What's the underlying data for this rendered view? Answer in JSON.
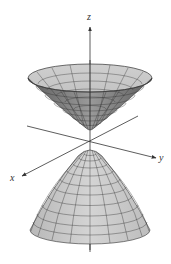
{
  "figure": {
    "axes": {
      "x_label": "x",
      "y_label": "y",
      "z_label": "z"
    },
    "colors": {
      "surface_fill": "#c8c8c8",
      "surface_fill_dark": "#8e8e8e",
      "grid_line": "#3a3a3a",
      "axis_line": "#333333",
      "background": "#ffffff"
    },
    "sheets": [
      {
        "name": "upper-sheet",
        "opens": "up"
      },
      {
        "name": "lower-sheet",
        "opens": "down"
      }
    ]
  }
}
